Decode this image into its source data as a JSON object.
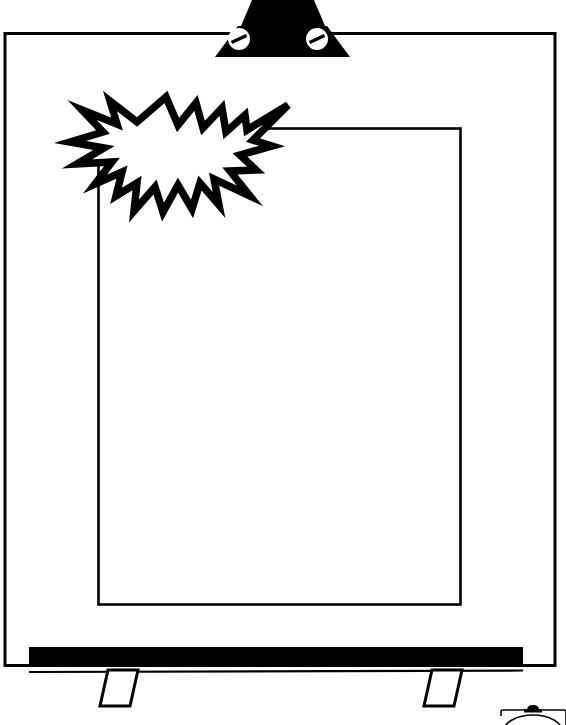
{
  "image": {
    "title": "Blank Easel With Starburst",
    "subject": "easel-flip-chart",
    "style": "black-and-white line art clipart",
    "background_color": "#FFFFFF",
    "ink_color": "#000000",
    "canvas": {
      "width": 566,
      "height": 725
    }
  },
  "parts": {
    "board_frame": {
      "name": "Outer board frame",
      "stroke_color": "#000000",
      "fill_color": "#FFFFFF"
    },
    "clamp": {
      "name": "Top clamp",
      "fill_color": "#000000",
      "screw_count": 2,
      "screw_fill_color": "#FFFFFF",
      "screw_slot_color": "#000000"
    },
    "paper_sheet": {
      "name": "Inner paper sheet",
      "stroke_color": "#000000",
      "fill_color": "#FFFFFF"
    },
    "starburst": {
      "name": "Starburst burst shape",
      "stroke_color": "#000000",
      "fill_color": "#FFFFFF",
      "point_count": 17,
      "label": ""
    },
    "tray": {
      "name": "Marker tray",
      "fill_color": "#000000"
    },
    "legs": {
      "name": "Easel legs",
      "count": 2,
      "stroke_color": "#000000",
      "fill_color": "#FFFFFF"
    },
    "watermark": {
      "name": "Corner watermark badge",
      "stroke_color": "#000000",
      "knob_color": "#000000",
      "cropped": "true"
    }
  }
}
